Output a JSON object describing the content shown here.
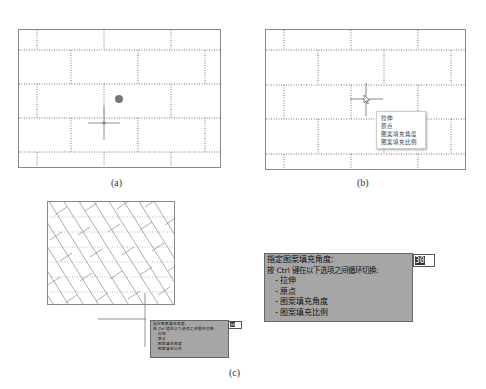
{
  "panels": {
    "a": {
      "caption": "(a)"
    },
    "b": {
      "caption": "(b)",
      "context_menu": [
        "拉伸",
        "原点",
        "图案填充角度",
        "图案填充比例"
      ]
    },
    "c": {
      "caption": "(c)",
      "tooltip_small": {
        "title": "指定图案填充角度:",
        "hint": "按 Ctrl 键在以下选项之间循环切换:",
        "options": [
          "- 拉伸",
          "- 原点",
          "- 图案填充角度",
          "- 图案填充比例"
        ],
        "input_value": "30"
      }
    }
  },
  "enlarged_tooltip": {
    "title": "指定图案填充角度:",
    "hint": "按 Ctrl 键在以下选项之间循环切换:",
    "options": [
      "- 拉伸",
      "- 原点",
      "- 图案填充角度",
      "- 图案填充比例"
    ],
    "input_value": "30"
  },
  "colors": {
    "frame": "#888888",
    "dotted": "#555555",
    "grip": "#777777",
    "tooltip_bg": "#a6a6a6"
  }
}
